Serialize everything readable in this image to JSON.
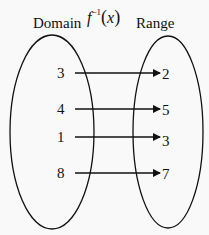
{
  "title": {
    "function": "f",
    "superscript": "−1",
    "open_paren": "(",
    "variable": "x",
    "close_paren": ")"
  },
  "domain_label": "Domain",
  "range_label": "Range",
  "mapping": [
    {
      "from": "3",
      "to": "2"
    },
    {
      "from": "4",
      "to": "5"
    },
    {
      "from": "1",
      "to": "3"
    },
    {
      "from": "8",
      "to": "7"
    }
  ],
  "colors": {
    "stroke": "#111111",
    "background": "#f9f9f9"
  }
}
